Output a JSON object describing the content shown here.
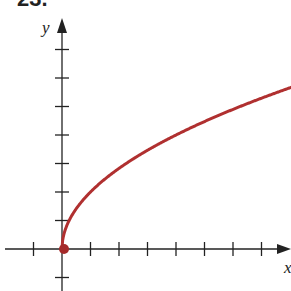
{
  "problem_number": "23.",
  "colors": {
    "curve": "#b03030",
    "axis": "#222222",
    "point": "#a52a2a"
  },
  "chart_data": {
    "type": "line",
    "title": "",
    "function": "y = 2*sqrt(x)",
    "xlabel": "x",
    "ylabel": "y",
    "tick_labels_shown": false,
    "x_ticks": [
      -1,
      1,
      2,
      3,
      4,
      5,
      6,
      7
    ],
    "y_ticks": [
      -1,
      1,
      2,
      3,
      4,
      5,
      6,
      7
    ],
    "xlim": [
      -2.2,
      8.0
    ],
    "ylim": [
      -1.5,
      8.0
    ],
    "grid": false,
    "legend": null,
    "series": [
      {
        "name": "y = 2√x",
        "start_point": {
          "x": 0,
          "y": 0,
          "marker": "filled-circle"
        },
        "x": [
          0,
          0.25,
          0.5,
          1,
          2,
          3,
          4,
          5,
          6,
          7,
          8
        ],
        "y": [
          0,
          1,
          1.41,
          2,
          2.83,
          3.46,
          4,
          4.47,
          4.9,
          5.29,
          5.66
        ]
      }
    ]
  }
}
